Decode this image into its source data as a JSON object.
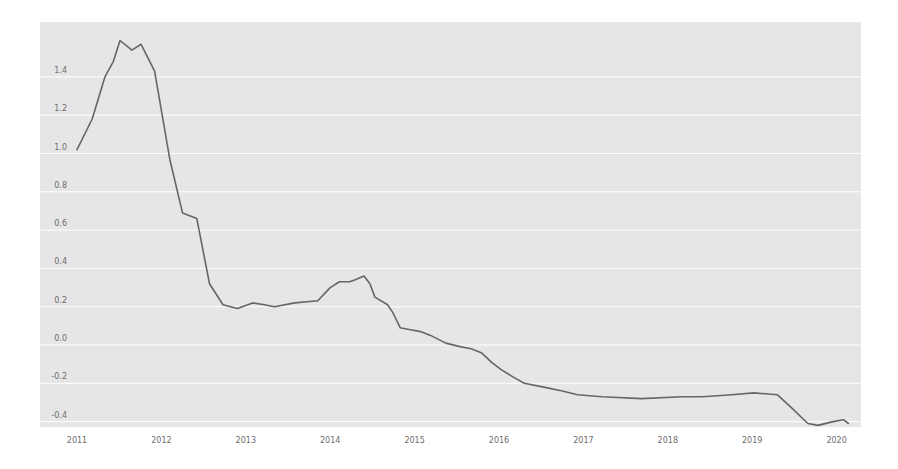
{
  "chart_data": {
    "type": "line",
    "title": "",
    "xlabel": "",
    "ylabel": "",
    "xlim": [
      2010.85,
      2020.28
    ],
    "ylim": [
      -0.45,
      1.67
    ],
    "grid": true,
    "legend": null,
    "x_ticks": [
      "2011",
      "2012",
      "2013",
      "2014",
      "2015",
      "2016",
      "2017",
      "2018",
      "2019",
      "2020"
    ],
    "y_ticks": [
      "1.4",
      "1.2",
      "1.0",
      "0.8",
      "0.6",
      "0.4",
      "0.2",
      "0.0",
      "-0.2",
      "-0.4"
    ],
    "colors": {
      "background": "#e6e6e6",
      "grid": "#ffffff",
      "line": "#666666"
    },
    "series": [
      {
        "name": "value",
        "x": [
          2011.0,
          2011.18,
          2011.33,
          2011.43,
          2011.51,
          2011.65,
          2011.76,
          2011.92,
          2012.1,
          2012.25,
          2012.42,
          2012.57,
          2012.73,
          2012.9,
          2013.08,
          2013.22,
          2013.34,
          2013.58,
          2013.82,
          2013.85,
          2014.0,
          2014.11,
          2014.23,
          2014.29,
          2014.4,
          2014.47,
          2014.53,
          2014.68,
          2014.74,
          2014.83,
          2014.95,
          2015.07,
          2015.19,
          2015.37,
          2015.55,
          2015.67,
          2015.79,
          2015.91,
          2016.03,
          2016.18,
          2016.3,
          2016.53,
          2016.75,
          2016.93,
          2017.22,
          2017.69,
          2018.17,
          2018.41,
          2018.76,
          2019.02,
          2019.3,
          2019.47,
          2019.66,
          2019.78,
          2019.96,
          2020.08,
          2020.14
        ],
        "values": [
          1.02,
          1.18,
          1.4,
          1.48,
          1.59,
          1.54,
          1.57,
          1.43,
          0.97,
          0.69,
          0.66,
          0.32,
          0.21,
          0.19,
          0.22,
          0.21,
          0.2,
          0.22,
          0.23,
          0.23,
          0.3,
          0.33,
          0.33,
          0.34,
          0.36,
          0.32,
          0.25,
          0.21,
          0.17,
          0.09,
          0.08,
          0.07,
          0.05,
          0.01,
          -0.01,
          -0.02,
          -0.04,
          -0.09,
          -0.13,
          -0.17,
          -0.2,
          -0.22,
          -0.24,
          -0.26,
          -0.27,
          -0.28,
          -0.27,
          -0.27,
          -0.26,
          -0.25,
          -0.26,
          -0.33,
          -0.41,
          -0.42,
          -0.4,
          -0.39,
          -0.41
        ]
      }
    ]
  }
}
